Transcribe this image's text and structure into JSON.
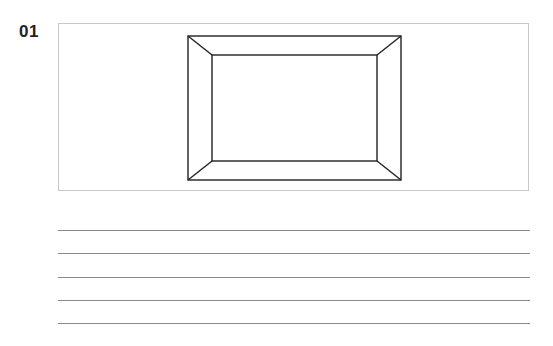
{
  "question": {
    "number": "01"
  },
  "figure": {
    "stroke_color": "#222222",
    "box_border_color": "#c8c8c8",
    "outer_rect": {
      "x1": 188,
      "y1": 36,
      "x2": 401,
      "y2": 180
    },
    "inner_rect": {
      "x1": 212,
      "y1": 55,
      "x2": 377,
      "y2": 161
    }
  },
  "answer_lines": {
    "count": 5,
    "y_positions": [
      230,
      253,
      277,
      300,
      323
    ],
    "color": "#8a8a8a"
  }
}
